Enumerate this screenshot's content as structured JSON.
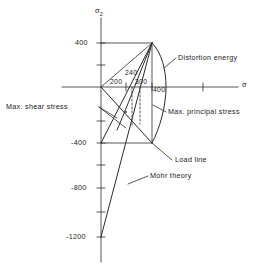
{
  "figure": {
    "type": "line",
    "axes": {
      "y_axis_label": "σ",
      "y_axis_sub": "2",
      "x_axis_label": "σ",
      "origin_px": [
        101,
        87
      ],
      "px_per_unit_x": 0.1275,
      "px_per_unit_y": 0.11,
      "x_range": [
        -200,
        1100
      ],
      "y_range": [
        -1350,
        600
      ],
      "y_ticks": [
        400,
        200,
        0,
        -200,
        -400,
        -600,
        -800,
        -1000,
        -1200
      ],
      "y_tick_labels": [
        "400",
        "",
        "",
        "",
        "-400",
        "",
        "-800",
        "",
        "-1200"
      ],
      "x_ticks": [
        200,
        400,
        800
      ],
      "grid": false
    },
    "tick_text": {
      "y400": "400",
      "yneg400": "-400",
      "yneg800": "-800",
      "yneg1200": "-1200",
      "x200": "200",
      "x240": "240",
      "x300": "300",
      "x400": "400"
    },
    "annotations": [
      {
        "id": "distortion-energy",
        "text": "Distortion  energy"
      },
      {
        "id": "max-principal-stress",
        "text": "Max. principal  stress"
      },
      {
        "id": "max-shear-stress",
        "text": "Max. shear  stress"
      },
      {
        "id": "load-line",
        "text": "Load  line"
      },
      {
        "id": "mohr-theory",
        "text": "Mohr  theory"
      }
    ],
    "series": [
      {
        "name": "Max. principal stress",
        "kind": "envelope-box",
        "points": [
          [
            0,
            400
          ],
          [
            400,
            400
          ],
          [
            400,
            -400
          ],
          [
            0,
            -400
          ]
        ]
      },
      {
        "name": "Distortion energy",
        "kind": "ellipse-arc",
        "points": [
          [
            400,
            400
          ],
          [
            460,
            200
          ],
          [
            470,
            0
          ],
          [
            430,
            -220
          ],
          [
            400,
            -400
          ]
        ]
      },
      {
        "name": "Max. shear stress",
        "kind": "line",
        "points": [
          [
            0,
            0
          ],
          [
            400,
            -400
          ]
        ]
      },
      {
        "name": "Max. shear stress envelope",
        "kind": "line",
        "points": [
          [
            400,
            400
          ],
          [
            0,
            -400
          ]
        ]
      },
      {
        "name": "Mohr theory",
        "kind": "line",
        "points": [
          [
            400,
            400
          ],
          [
            0,
            -1200
          ]
        ]
      },
      {
        "name": "Load line",
        "kind": "line",
        "points": [
          [
            0,
            0
          ],
          [
            400,
            400
          ]
        ]
      }
    ],
    "dashed_guides": [
      {
        "x": 240,
        "from_y": 0,
        "to_y": -240
      },
      {
        "x": 300,
        "from_y": 0,
        "to_y": -300
      }
    ],
    "colors": {
      "stroke": "#2b2b2b",
      "background": "#ffffff"
    }
  }
}
